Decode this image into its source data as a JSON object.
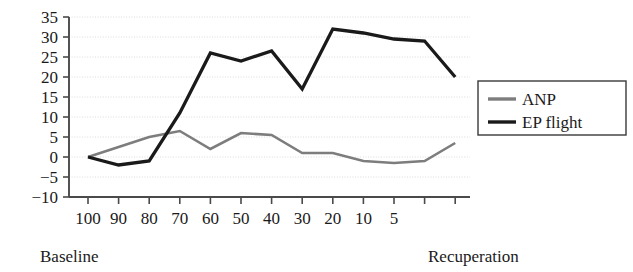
{
  "chart_data": {
    "type": "line",
    "title": "",
    "subtitle": "",
    "xlabel": "",
    "ylabel": "",
    "grid": true,
    "legend_position": "right",
    "ylim": [
      -10,
      35
    ],
    "y_ticks": [
      35,
      30,
      25,
      20,
      15,
      10,
      5,
      0,
      -5,
      -10
    ],
    "x_tick_labels": [
      "100",
      "90",
      "80",
      "70",
      "60",
      "50",
      "40",
      "30",
      "20",
      "10",
      "5",
      "",
      ""
    ],
    "x_axis_start_caption": "Baseline",
    "x_axis_end_caption": "Recuperation",
    "series": [
      {
        "name": "ANP",
        "color": "#7d7d7d",
        "values": [
          0,
          2.5,
          5,
          6.5,
          2,
          6,
          5.5,
          1,
          1,
          -1,
          -1.5,
          -1,
          3.5
        ]
      },
      {
        "name": "EP flight",
        "color": "#1a1a1a",
        "values": [
          0,
          -2,
          -1,
          11,
          26,
          24,
          26.5,
          17,
          32,
          31,
          29.5,
          29,
          20
        ]
      }
    ],
    "legend_entries": [
      {
        "label": "ANP",
        "color": "#7d7d7d"
      },
      {
        "label": "EP flight",
        "color": "#1a1a1a"
      }
    ]
  },
  "colors": {
    "background": "#ffffff",
    "axis": "#4a4a4a",
    "grid": "#d8d8d8",
    "text": "#1a1a1a",
    "anp_series": "#7d7d7d",
    "ep_flight_series": "#1a1a1a"
  }
}
